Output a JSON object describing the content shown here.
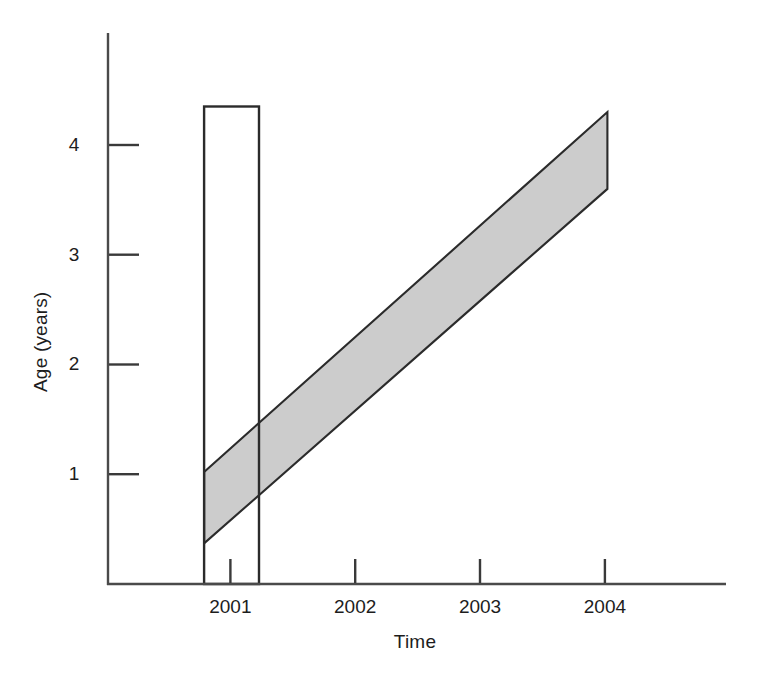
{
  "chart_data": {
    "type": "area",
    "title": "",
    "xlabel": "Time",
    "ylabel": "Age (years)",
    "xtick_labels": [
      "2001",
      "2002",
      "2003",
      "2004"
    ],
    "xtick_values": [
      2001,
      2002,
      2003,
      2004
    ],
    "ytick_labels": [
      "1",
      "2",
      "3",
      "4"
    ],
    "ytick_values": [
      1,
      2,
      3,
      4
    ],
    "xlim": [
      2000.02,
      2004.97
    ],
    "ylim": [
      0.0,
      5.02
    ],
    "grid": false,
    "legend": null,
    "tick_direction": "in",
    "series": [
      {
        "name": "cohort-age-band",
        "type": "band",
        "fill": "#cccccc",
        "edge": "#2b2b2b",
        "description": "Shaded diagonal band: age increases with time at one year per year; band width about 0.65 years.",
        "vertices": [
          {
            "x": 2000.79,
            "y": 1.02
          },
          {
            "x": 2004.02,
            "y": 4.3
          },
          {
            "x": 2004.02,
            "y": 3.6
          },
          {
            "x": 2000.79,
            "y": 0.37
          }
        ],
        "lower_line": {
          "x": [
            2000.79,
            2004.02
          ],
          "y": [
            0.37,
            3.6
          ]
        },
        "upper_line": {
          "x": [
            2000.79,
            2004.02
          ],
          "y": [
            1.02,
            4.3
          ]
        }
      },
      {
        "name": "sampling-window-bar",
        "type": "bar",
        "fill": "none",
        "edge": "#2b2b2b",
        "description": "Open (unfilled) vertical rectangle spanning the 2001 sampling window.",
        "x_start": 2000.79,
        "x_end": 2001.23,
        "y_base": 0.0,
        "y_top": 4.35
      }
    ]
  },
  "axes": {
    "y_axis_name": "y-axis-line",
    "x_axis_name": "x-axis-line"
  }
}
